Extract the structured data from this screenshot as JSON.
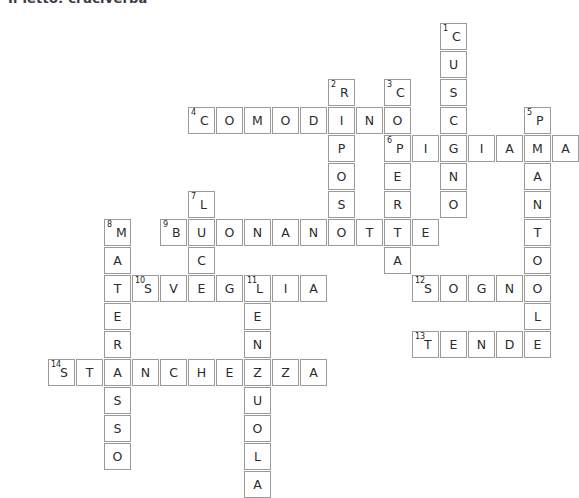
{
  "page": {
    "title": "Il letto: cruciverba",
    "background_color": "#ffffff",
    "cell_border_color": "#9a9a9a",
    "letter_color": "#2b2b2b"
  },
  "crossword": {
    "cell_size": 28,
    "origin_x": 20,
    "origin_y": 23,
    "numbers_visible": [
      1,
      2,
      3,
      4,
      5,
      6,
      7,
      8,
      9,
      10,
      11,
      12,
      13,
      14
    ],
    "entries": [
      {
        "number": 1,
        "direction": "down",
        "answer": "CUSCINO",
        "row": 0,
        "col": 15
      },
      {
        "number": 2,
        "direction": "down",
        "answer": "RIPOSO",
        "row": 2,
        "col": 11
      },
      {
        "number": 3,
        "direction": "down",
        "answer": "COPERTA",
        "row": 2,
        "col": 13
      },
      {
        "number": 4,
        "direction": "across",
        "answer": "COMODINO",
        "row": 3,
        "col": 6
      },
      {
        "number": 5,
        "direction": "down",
        "answer": "PANTOFOLE",
        "row": 3,
        "col": 18
      },
      {
        "number": 6,
        "direction": "across",
        "answer": "PIGIAMA",
        "row": 4,
        "col": 13
      },
      {
        "number": 7,
        "direction": "down",
        "answer": "LUCE",
        "row": 6,
        "col": 6
      },
      {
        "number": 8,
        "direction": "down",
        "answer": "MATERASSO",
        "row": 7,
        "col": 3
      },
      {
        "number": 9,
        "direction": "across",
        "answer": "BUONANOTTE",
        "row": 7,
        "col": 5
      },
      {
        "number": 10,
        "direction": "across",
        "answer": "SVEGLIA",
        "row": 9,
        "col": 4
      },
      {
        "number": 11,
        "direction": "down",
        "answer": "LENZUOLA",
        "row": 9,
        "col": 8
      },
      {
        "number": 12,
        "direction": "across",
        "answer": "SOGNO",
        "row": 9,
        "col": 14
      },
      {
        "number": 13,
        "direction": "across",
        "answer": "TENDE",
        "row": 11,
        "col": 14
      },
      {
        "number": 14,
        "direction": "across",
        "answer": "STANCHEZZA",
        "row": 12,
        "col": 1
      }
    ],
    "cells": [
      {
        "row": 0,
        "col": 15,
        "letter": "C",
        "number": "1"
      },
      {
        "row": 1,
        "col": 15,
        "letter": "U",
        "number": null
      },
      {
        "row": 2,
        "col": 15,
        "letter": "S",
        "number": null
      },
      {
        "row": 2,
        "col": 11,
        "letter": "R",
        "number": "2"
      },
      {
        "row": 2,
        "col": 13,
        "letter": "C",
        "number": "3"
      },
      {
        "row": 3,
        "col": 6,
        "letter": "C",
        "number": "4"
      },
      {
        "row": 3,
        "col": 7,
        "letter": "O",
        "number": null
      },
      {
        "row": 3,
        "col": 8,
        "letter": "M",
        "number": null
      },
      {
        "row": 3,
        "col": 9,
        "letter": "O",
        "number": null
      },
      {
        "row": 3,
        "col": 10,
        "letter": "D",
        "number": null
      },
      {
        "row": 3,
        "col": 11,
        "letter": "I",
        "number": null
      },
      {
        "row": 3,
        "col": 12,
        "letter": "N",
        "number": null
      },
      {
        "row": 3,
        "col": 13,
        "letter": "O",
        "number": null
      },
      {
        "row": 3,
        "col": 15,
        "letter": "C",
        "number": null
      },
      {
        "row": 3,
        "col": 18,
        "letter": "P",
        "number": "5"
      },
      {
        "row": 4,
        "col": 11,
        "letter": "P",
        "number": null
      },
      {
        "row": 4,
        "col": 13,
        "letter": "P",
        "number": "6"
      },
      {
        "row": 4,
        "col": 14,
        "letter": "I",
        "number": null
      },
      {
        "row": 4,
        "col": 15,
        "letter": "G",
        "number": null
      },
      {
        "row": 4,
        "col": 16,
        "letter": "I",
        "number": null
      },
      {
        "row": 4,
        "col": 17,
        "letter": "A",
        "number": null
      },
      {
        "row": 4,
        "col": 18,
        "letter": "M",
        "number": null
      },
      {
        "row": 4,
        "col": 19,
        "letter": "A",
        "number": null
      },
      {
        "row": 5,
        "col": 11,
        "letter": "O",
        "number": null
      },
      {
        "row": 5,
        "col": 13,
        "letter": "E",
        "number": null
      },
      {
        "row": 5,
        "col": 15,
        "letter": "N",
        "number": null
      },
      {
        "row": 5,
        "col": 18,
        "letter": "A",
        "number": null
      },
      {
        "row": 6,
        "col": 6,
        "letter": "L",
        "number": "7"
      },
      {
        "row": 6,
        "col": 11,
        "letter": "S",
        "number": null
      },
      {
        "row": 6,
        "col": 13,
        "letter": "R",
        "number": null
      },
      {
        "row": 6,
        "col": 15,
        "letter": "O",
        "number": null
      },
      {
        "row": 6,
        "col": 18,
        "letter": "N",
        "number": null
      },
      {
        "row": 7,
        "col": 3,
        "letter": "M",
        "number": "8"
      },
      {
        "row": 7,
        "col": 5,
        "letter": "B",
        "number": "9"
      },
      {
        "row": 7,
        "col": 6,
        "letter": "U",
        "number": null
      },
      {
        "row": 7,
        "col": 7,
        "letter": "O",
        "number": null
      },
      {
        "row": 7,
        "col": 8,
        "letter": "N",
        "number": null
      },
      {
        "row": 7,
        "col": 9,
        "letter": "A",
        "number": null
      },
      {
        "row": 7,
        "col": 10,
        "letter": "N",
        "number": null
      },
      {
        "row": 7,
        "col": 11,
        "letter": "O",
        "number": null
      },
      {
        "row": 7,
        "col": 12,
        "letter": "T",
        "number": null
      },
      {
        "row": 7,
        "col": 13,
        "letter": "T",
        "number": null
      },
      {
        "row": 7,
        "col": 14,
        "letter": "E",
        "number": null
      },
      {
        "row": 7,
        "col": 18,
        "letter": "T",
        "number": null
      },
      {
        "row": 8,
        "col": 3,
        "letter": "A",
        "number": null
      },
      {
        "row": 8,
        "col": 6,
        "letter": "C",
        "number": null
      },
      {
        "row": 8,
        "col": 13,
        "letter": "A",
        "number": null
      },
      {
        "row": 8,
        "col": 18,
        "letter": "O",
        "number": null
      },
      {
        "row": 9,
        "col": 3,
        "letter": "T",
        "number": null
      },
      {
        "row": 9,
        "col": 4,
        "letter": "S",
        "number": "10"
      },
      {
        "row": 9,
        "col": 5,
        "letter": "V",
        "number": null
      },
      {
        "row": 9,
        "col": 6,
        "letter": "E",
        "number": null
      },
      {
        "row": 9,
        "col": 7,
        "letter": "G",
        "number": null
      },
      {
        "row": 9,
        "col": 8,
        "letter": "L",
        "number": "11"
      },
      {
        "row": 9,
        "col": 9,
        "letter": "I",
        "number": null
      },
      {
        "row": 9,
        "col": 10,
        "letter": "A",
        "number": null
      },
      {
        "row": 9,
        "col": 14,
        "letter": "S",
        "number": "12"
      },
      {
        "row": 9,
        "col": 15,
        "letter": "O",
        "number": null
      },
      {
        "row": 9,
        "col": 16,
        "letter": "G",
        "number": null
      },
      {
        "row": 9,
        "col": 17,
        "letter": "N",
        "number": null
      },
      {
        "row": 9,
        "col": 18,
        "letter": "O",
        "number": null
      },
      {
        "row": 10,
        "col": 3,
        "letter": "E",
        "number": null
      },
      {
        "row": 10,
        "col": 8,
        "letter": "E",
        "number": null
      },
      {
        "row": 10,
        "col": 18,
        "letter": "L",
        "number": null
      },
      {
        "row": 11,
        "col": 3,
        "letter": "R",
        "number": null
      },
      {
        "row": 11,
        "col": 8,
        "letter": "N",
        "number": null
      },
      {
        "row": 11,
        "col": 14,
        "letter": "T",
        "number": "13"
      },
      {
        "row": 11,
        "col": 15,
        "letter": "E",
        "number": null
      },
      {
        "row": 11,
        "col": 16,
        "letter": "N",
        "number": null
      },
      {
        "row": 11,
        "col": 17,
        "letter": "D",
        "number": null
      },
      {
        "row": 11,
        "col": 18,
        "letter": "E",
        "number": null
      },
      {
        "row": 12,
        "col": 1,
        "letter": "S",
        "number": "14"
      },
      {
        "row": 12,
        "col": 2,
        "letter": "T",
        "number": null
      },
      {
        "row": 12,
        "col": 3,
        "letter": "A",
        "number": null
      },
      {
        "row": 12,
        "col": 4,
        "letter": "N",
        "number": null
      },
      {
        "row": 12,
        "col": 5,
        "letter": "C",
        "number": null
      },
      {
        "row": 12,
        "col": 6,
        "letter": "H",
        "number": null
      },
      {
        "row": 12,
        "col": 7,
        "letter": "E",
        "number": null
      },
      {
        "row": 12,
        "col": 8,
        "letter": "Z",
        "number": null
      },
      {
        "row": 12,
        "col": 9,
        "letter": "Z",
        "number": null
      },
      {
        "row": 12,
        "col": 10,
        "letter": "A",
        "number": null
      },
      {
        "row": 13,
        "col": 3,
        "letter": "S",
        "number": null
      },
      {
        "row": 13,
        "col": 8,
        "letter": "U",
        "number": null
      },
      {
        "row": 14,
        "col": 3,
        "letter": "S",
        "number": null
      },
      {
        "row": 14,
        "col": 8,
        "letter": "O",
        "number": null
      },
      {
        "row": 15,
        "col": 3,
        "letter": "O",
        "number": null
      },
      {
        "row": 15,
        "col": 8,
        "letter": "L",
        "number": null
      },
      {
        "row": 16,
        "col": 8,
        "letter": "A",
        "number": null
      }
    ]
  }
}
